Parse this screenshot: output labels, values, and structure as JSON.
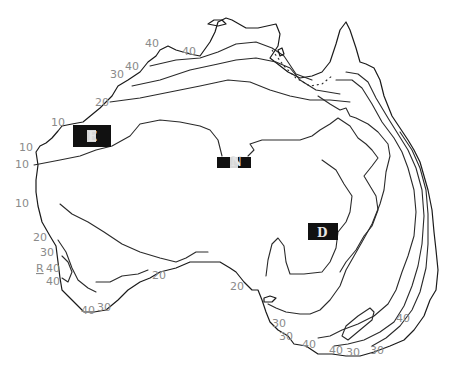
{
  "map": {
    "subject": "Australia contour map",
    "stroke_color": "#1a1a1a",
    "label_color": "#8a8a8a",
    "boxes": [
      {
        "id": "E",
        "label": "E",
        "x": 73,
        "y": 125,
        "w": 38,
        "h": 22
      },
      {
        "id": "N",
        "label": "N",
        "x": 217,
        "y": 157,
        "w": 34,
        "h": 11
      },
      {
        "id": "D",
        "label": "D",
        "x": 308,
        "y": 223,
        "w": 30,
        "h": 17
      }
    ],
    "contour_labels": [
      {
        "text": "40",
        "x": 145,
        "y": 47
      },
      {
        "text": "40",
        "x": 182,
        "y": 55
      },
      {
        "text": "30",
        "x": 110,
        "y": 78
      },
      {
        "text": "40",
        "x": 125,
        "y": 70
      },
      {
        "text": "20",
        "x": 95,
        "y": 106
      },
      {
        "text": "10",
        "x": 51,
        "y": 126
      },
      {
        "text": "10",
        "x": 19,
        "y": 151
      },
      {
        "text": "10",
        "x": 15,
        "y": 168
      },
      {
        "text": "10",
        "x": 15,
        "y": 207
      },
      {
        "text": "20",
        "x": 33,
        "y": 241
      },
      {
        "text": "30",
        "x": 40,
        "y": 256
      },
      {
        "text": "R",
        "x": 36,
        "y": 272
      },
      {
        "text": "40",
        "x": 46,
        "y": 272
      },
      {
        "text": "40",
        "x": 46,
        "y": 285
      },
      {
        "text": "40",
        "x": 81,
        "y": 314
      },
      {
        "text": "30",
        "x": 97,
        "y": 311
      },
      {
        "text": "20",
        "x": 152,
        "y": 279
      },
      {
        "text": "20",
        "x": 230,
        "y": 290
      },
      {
        "text": "30",
        "x": 272,
        "y": 327
      },
      {
        "text": "30",
        "x": 279,
        "y": 340
      },
      {
        "text": "40",
        "x": 302,
        "y": 348
      },
      {
        "text": "40",
        "x": 329,
        "y": 354
      },
      {
        "text": "30",
        "x": 346,
        "y": 356
      },
      {
        "text": "30",
        "x": 370,
        "y": 354
      },
      {
        "text": "40",
        "x": 396,
        "y": 322
      }
    ]
  }
}
